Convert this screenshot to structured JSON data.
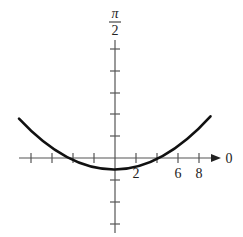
{
  "graph": {
    "type": "polar-graph",
    "curve": "parabola",
    "axis_labels": {
      "polar_axis": "0",
      "vertical_top_numer": "π",
      "vertical_top_denom": "2"
    },
    "tick_labels": [
      {
        "value": 2,
        "text": "2"
      },
      {
        "value": 6,
        "text": "6"
      },
      {
        "value": 8,
        "text": "8"
      }
    ],
    "tick_unit": 2,
    "px_per_unit": 10.5,
    "origin_px": [
      115,
      158
    ],
    "curve_equation": "y = x^2/12 - 3",
    "curve_vertex": [
      0,
      -3
    ],
    "curve_x_intercepts": [
      -6,
      6
    ],
    "colors": {
      "axis": "#555555",
      "curve": "#111111",
      "text": "#222222"
    }
  }
}
